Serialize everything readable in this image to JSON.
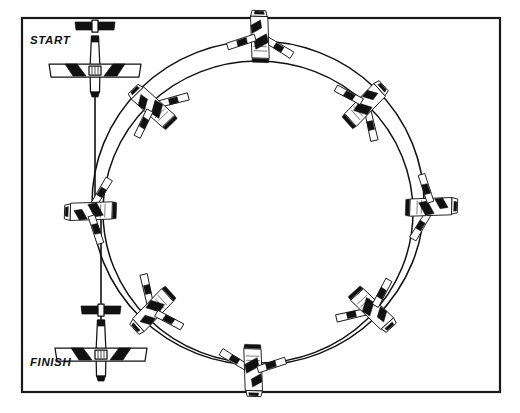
{
  "figure": {
    "background_color": "#ffffff",
    "ink_color": "#111111",
    "border": {
      "name": "figure-border",
      "x": 22,
      "y": 18,
      "width": 478,
      "height": 374,
      "stroke_width": 2.2
    }
  },
  "labels": {
    "start": "START",
    "finish": "FINISH",
    "start_pos": {
      "x": 30,
      "y": 44
    },
    "finish_pos": {
      "x": 30,
      "y": 366
    }
  },
  "flight_path": {
    "type": "spiral-720-turn",
    "description": "Two concentric offset circles representing a 720 degree steep turn, entered at START and exited at FINISH.",
    "circles": [
      {
        "name": "outer-track-circle",
        "cx": 258,
        "cy": 203,
        "rx": 166,
        "ry": 162
      },
      {
        "name": "inner-track-circle",
        "cx": 258,
        "cy": 212,
        "rx": 155,
        "ry": 151
      }
    ],
    "entry_line": {
      "name": "entry-leg",
      "x1": 95,
      "y1": 70,
      "x2": 95,
      "y2": 205
    },
    "exit_line": {
      "name": "exit-leg",
      "x1": 101,
      "y1": 215,
      "x2": 101,
      "y2": 348
    }
  },
  "aircraft": [
    {
      "id": "start-aircraft",
      "name": "aircraft-start",
      "view": "top-level",
      "cx": 95,
      "cy": 66,
      "rotation": 0,
      "scale": 1.0,
      "bank": "wings level"
    },
    {
      "id": "top-aircraft",
      "name": "aircraft-top",
      "view": "banked",
      "cx": 262,
      "cy": 38,
      "rotation": 182,
      "scale": 0.72,
      "bank": "steep left bank"
    },
    {
      "id": "upper-right-aircraft",
      "name": "aircraft-upper-right",
      "view": "banked",
      "cx": 366,
      "cy": 107,
      "rotation": 228,
      "scale": 0.72,
      "bank": "steep left bank"
    },
    {
      "id": "right-aircraft",
      "name": "aircraft-right",
      "view": "banked",
      "cx": 430,
      "cy": 209,
      "rotation": 272,
      "scale": 0.72,
      "bank": "steep left bank"
    },
    {
      "id": "lower-right-aircraft",
      "name": "aircraft-lower-right",
      "view": "banked",
      "cx": 370,
      "cy": 310,
      "rotation": 318,
      "scale": 0.72,
      "bank": "steep left bank"
    },
    {
      "id": "bottom-aircraft",
      "name": "aircraft-bottom",
      "view": "banked",
      "cx": 251,
      "cy": 369,
      "rotation": 2,
      "scale": 0.72,
      "bank": "steep left bank"
    },
    {
      "id": "lower-left-aircraft",
      "name": "aircraft-lower-left",
      "view": "banked",
      "cx": 152,
      "cy": 308,
      "rotation": 48,
      "scale": 0.72,
      "bank": "steep left bank"
    },
    {
      "id": "left-aircraft",
      "name": "aircraft-left",
      "view": "banked",
      "cx": 92,
      "cy": 209,
      "rotation": 92,
      "scale": 0.72,
      "bank": "steep left bank"
    },
    {
      "id": "upper-left-aircraft",
      "name": "aircraft-upper-left",
      "view": "banked",
      "cx": 155,
      "cy": 106,
      "rotation": 136,
      "scale": 0.72,
      "bank": "steep left bank"
    }
  ]
}
